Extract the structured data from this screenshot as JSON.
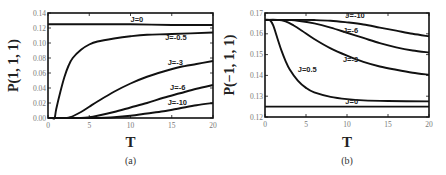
{
  "chart_data": [
    {
      "type": "line",
      "panel_label": "(a)",
      "title": "",
      "xlabel": "T",
      "ylabel": "P(1, 1, 1)",
      "xlim": [
        0,
        20
      ],
      "ylim": [
        0,
        0.14
      ],
      "xticks": [
        "0",
        "5",
        "10",
        "15",
        "20"
      ],
      "xtick_values": [
        0,
        5,
        10,
        15,
        20
      ],
      "yticks": [
        "0.00",
        "0.02",
        "0.04",
        "0.06",
        "0.08",
        "0.10",
        "0.12",
        "0.14"
      ],
      "ytick_values": [
        0,
        0.02,
        0.04,
        0.06,
        0.08,
        0.1,
        0.12,
        0.14
      ],
      "grid": false,
      "legend": "none (inline annotations)",
      "series": [
        {
          "name": "J=0",
          "label": "J=0",
          "label_at": [
            10,
            0.128
          ],
          "x": [
            0,
            5,
            10,
            15,
            20
          ],
          "y": [
            0.125,
            0.125,
            0.125,
            0.124,
            0.124
          ]
        },
        {
          "name": "J=-0.5",
          "label": "J=-0.5",
          "label_at": [
            14.2,
            0.104
          ],
          "x": [
            0,
            0.5,
            0.8,
            1,
            1.5,
            2,
            2.5,
            3,
            4,
            5,
            6,
            8,
            10,
            12,
            15,
            20
          ],
          "y": [
            0,
            0,
            0.0,
            0.012,
            0.035,
            0.055,
            0.07,
            0.08,
            0.091,
            0.098,
            0.102,
            0.106,
            0.109,
            0.111,
            0.112,
            0.114
          ]
        },
        {
          "name": "J=-3",
          "label": "J=-3",
          "label_at": [
            14.5,
            0.071
          ],
          "x": [
            0,
            2,
            2.7,
            4,
            5,
            6,
            8,
            10,
            12,
            14,
            16,
            18,
            20
          ],
          "y": [
            0,
            0,
            0.001,
            0.008,
            0.015,
            0.022,
            0.035,
            0.046,
            0.055,
            0.062,
            0.068,
            0.072,
            0.076
          ]
        },
        {
          "name": "J=-6",
          "label": "J=-6",
          "label_at": [
            14.8,
            0.038
          ],
          "x": [
            0,
            4,
            5,
            6,
            8,
            10,
            12,
            14,
            16,
            18,
            20
          ],
          "y": [
            0,
            0,
            0.001,
            0.003,
            0.008,
            0.014,
            0.02,
            0.027,
            0.033,
            0.039,
            0.044
          ]
        },
        {
          "name": "J=-10",
          "label": "J=-10",
          "label_at": [
            14.5,
            0.018
          ],
          "x": [
            0,
            6,
            8,
            10,
            12,
            14,
            16,
            18,
            20
          ],
          "y": [
            0,
            0,
            0.001,
            0.003,
            0.006,
            0.009,
            0.013,
            0.017,
            0.02
          ]
        }
      ]
    },
    {
      "type": "line",
      "panel_label": "(b)",
      "title": "",
      "xlabel": "T",
      "ylabel": "P(−1, 1, 1)",
      "xlim": [
        0,
        20
      ],
      "ylim": [
        0.12,
        0.17
      ],
      "xticks": [
        "0",
        "5",
        "10",
        "15",
        "20"
      ],
      "xtick_values": [
        0,
        5,
        10,
        15,
        20
      ],
      "yticks": [
        "0.12",
        "0.13",
        "0.14",
        "0.15",
        "0.16",
        "0.17"
      ],
      "ytick_values": [
        0.12,
        0.13,
        0.14,
        0.15,
        0.16,
        0.17
      ],
      "grid": false,
      "legend": "none (inline annotations)",
      "series": [
        {
          "name": "J=-10",
          "label": "J=-10",
          "label_at": [
            9.8,
            0.1675
          ],
          "x": [
            0,
            4,
            6,
            8,
            10,
            12,
            14,
            16,
            18,
            20
          ],
          "y": [
            0.1667,
            0.1667,
            0.1666,
            0.1663,
            0.1655,
            0.1645,
            0.163,
            0.1615,
            0.16,
            0.1588
          ]
        },
        {
          "name": "J=-6",
          "label": "J=-6",
          "label_at": [
            9.5,
            0.1605
          ],
          "x": [
            0,
            2,
            3,
            4,
            6,
            8,
            10,
            12,
            14,
            16,
            18,
            20
          ],
          "y": [
            0.1667,
            0.1667,
            0.1666,
            0.1663,
            0.165,
            0.163,
            0.1605,
            0.158,
            0.1555,
            0.1535,
            0.152,
            0.151
          ]
        },
        {
          "name": "J=-3",
          "label": "J=-3",
          "label_at": [
            9.5,
            0.1465
          ],
          "x": [
            0,
            1.5,
            2.5,
            3.5,
            4.5,
            6,
            8,
            10,
            12,
            14,
            16,
            18,
            20
          ],
          "y": [
            0.1667,
            0.1667,
            0.166,
            0.164,
            0.1615,
            0.1575,
            0.153,
            0.1495,
            0.1465,
            0.1443,
            0.1427,
            0.1413,
            0.1403
          ]
        },
        {
          "name": "J=0.5",
          "label": "J=0.5",
          "label_at": [
            4,
            0.1415
          ],
          "x": [
            0,
            0.6,
            1,
            1.5,
            2,
            2.5,
            3,
            4,
            5,
            6,
            8,
            10,
            12,
            15,
            20
          ],
          "y": [
            0.1667,
            0.1665,
            0.164,
            0.158,
            0.152,
            0.147,
            0.143,
            0.1375,
            0.134,
            0.1318,
            0.1297,
            0.1286,
            0.128,
            0.1277,
            0.1275
          ]
        },
        {
          "name": "J=0",
          "label": "J=0",
          "label_at": [
            9.8,
            0.1262
          ],
          "x": [
            0,
            5,
            10,
            15,
            20
          ],
          "y": [
            0.125,
            0.125,
            0.125,
            0.125,
            0.125
          ]
        }
      ]
    }
  ]
}
